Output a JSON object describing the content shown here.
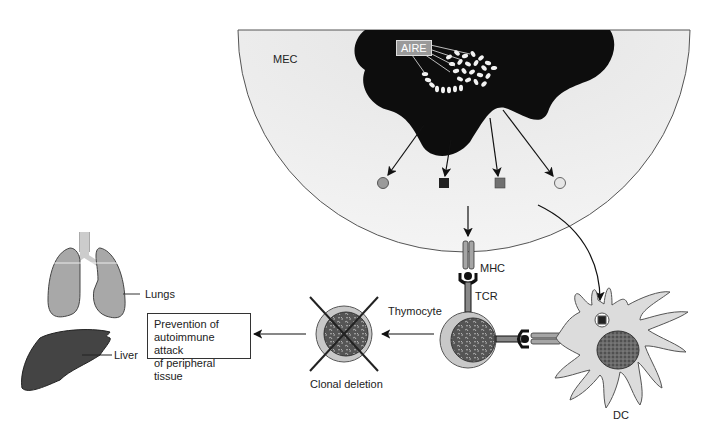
{
  "labels": {
    "mec": "MEC",
    "aire": "AIRE",
    "mhc": "MHC",
    "tcr": "TCR",
    "thymocyte": "Thymocyte",
    "dc": "DC",
    "clonal_deletion": "Clonal deletion",
    "lungs": "Lungs",
    "liver": "Liver"
  },
  "outcome_box": {
    "lines": [
      "Prevention of",
      "autoimmune attack",
      "of peripheral tissue"
    ]
  },
  "antigens": [
    {
      "shape": "circle",
      "color": "#9a9a9a"
    },
    {
      "shape": "square",
      "color": "#222222"
    },
    {
      "shape": "square",
      "color": "#707070"
    },
    {
      "shape": "circle",
      "color": "#e6e6e6"
    }
  ],
  "colors": {
    "mec_fill": "#ececec",
    "nucleus_fill": "#0d0d0d",
    "cell_fill": "#c8c8c8",
    "organ_lung": "#a8a8a8",
    "organ_liver": "#444444"
  }
}
